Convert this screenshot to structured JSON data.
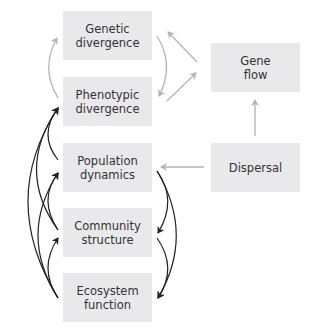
{
  "diagram": {
    "nodes": [
      {
        "id": "genetic",
        "lines": [
          "Genetic",
          "divergence"
        ]
      },
      {
        "id": "phenotypic",
        "lines": [
          "Phenotypic",
          "divergence"
        ]
      },
      {
        "id": "population",
        "lines": [
          "Population",
          "dynamics"
        ]
      },
      {
        "id": "community",
        "lines": [
          "Community",
          "structure"
        ]
      },
      {
        "id": "ecosystem",
        "lines": [
          "Ecosystem",
          "function"
        ]
      },
      {
        "id": "geneflow",
        "lines": [
          "Gene",
          "flow"
        ]
      },
      {
        "id": "dispersal",
        "lines": [
          "Dispersal"
        ]
      }
    ],
    "edges": {
      "gray": [
        {
          "from": "phenotypic",
          "to": "genetic"
        },
        {
          "from": "genetic",
          "to": "phenotypic"
        },
        {
          "from": "geneflow",
          "to": "genetic"
        },
        {
          "from": "phenotypic",
          "to": "geneflow"
        },
        {
          "from": "dispersal",
          "to": "geneflow"
        },
        {
          "from": "dispersal",
          "to": "population"
        }
      ],
      "black": [
        {
          "from": "population",
          "to": "phenotypic"
        },
        {
          "from": "community",
          "to": "phenotypic"
        },
        {
          "from": "ecosystem",
          "to": "phenotypic"
        },
        {
          "from": "community",
          "to": "population"
        },
        {
          "from": "ecosystem",
          "to": "population"
        },
        {
          "from": "ecosystem",
          "to": "community"
        },
        {
          "from": "population",
          "to": "community"
        },
        {
          "from": "population",
          "to": "ecosystem"
        },
        {
          "from": "community",
          "to": "ecosystem"
        }
      ]
    },
    "colors": {
      "box": "#e9e9ec",
      "gray_arrow": "#b4b4b4",
      "black_arrow": "#222222",
      "text": "#333333"
    }
  }
}
